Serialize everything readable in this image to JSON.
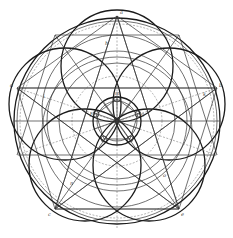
{
  "figure": {
    "center": [
      117,
      121
    ],
    "outer_radius": 103,
    "inner_radius": 24,
    "vertices": [
      [
        117,
        16
      ],
      [
        17,
        88
      ],
      [
        217,
        88
      ],
      [
        55,
        209
      ],
      [
        179,
        209
      ]
    ],
    "ink_color": "#1a1a1a",
    "background": "#ffffff"
  },
  "labels": {
    "top": "a",
    "left": "d",
    "right": "b",
    "bottom_left": "c",
    "bottom_right": "e",
    "center_top": "m",
    "inner_left": "f",
    "inner_right": "g",
    "upper_mid": "h",
    "left_mid": "i",
    "right_mid": "k",
    "lower_left": "n",
    "lower_right": "o"
  }
}
